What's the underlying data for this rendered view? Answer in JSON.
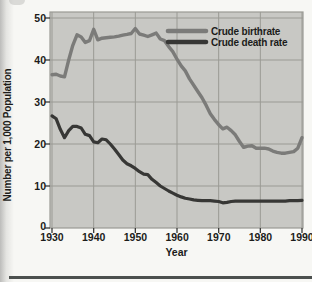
{
  "figure": {
    "bottom_rule_color": "#4c504e"
  },
  "chart_data": {
    "type": "line",
    "title": "",
    "xlabel": "Year",
    "ylabel": "Number per 1,000 Population",
    "xlim": [
      1930,
      1990
    ],
    "ylim": [
      0,
      50
    ],
    "x_ticks": [
      1930,
      1940,
      1950,
      1960,
      1970,
      1980,
      1990
    ],
    "y_ticks": [
      0,
      10,
      20,
      30,
      40,
      50
    ],
    "grid": true,
    "legend_position": "top-right-inside",
    "plot_bg": "#c8c8c4",
    "grid_color": "#9a9a94",
    "tick_color": "#3a3a38",
    "x": [
      1930,
      1931,
      1932,
      1933,
      1934,
      1935,
      1936,
      1937,
      1938,
      1939,
      1940,
      1941,
      1942,
      1943,
      1944,
      1945,
      1946,
      1947,
      1948,
      1949,
      1950,
      1951,
      1952,
      1953,
      1954,
      1955,
      1956,
      1957,
      1958,
      1959,
      1960,
      1961,
      1962,
      1963,
      1964,
      1965,
      1966,
      1967,
      1968,
      1969,
      1970,
      1971,
      1972,
      1973,
      1974,
      1975,
      1976,
      1977,
      1978,
      1979,
      1980,
      1981,
      1982,
      1983,
      1984,
      1985,
      1986,
      1987,
      1988,
      1989,
      1990
    ],
    "series": [
      {
        "name": "Crude birthrate",
        "color": "#7b7b79",
        "width": 3.4,
        "values": [
          36.5,
          36.6,
          36.2,
          36.0,
          40.0,
          43.5,
          46.0,
          45.5,
          44.2,
          44.6,
          47.3,
          44.8,
          45.2,
          45.3,
          45.4,
          45.5,
          45.7,
          45.9,
          46.1,
          46.3,
          47.5,
          46.2,
          45.9,
          45.6,
          46.0,
          46.4,
          45.0,
          44.6,
          43.2,
          42.0,
          40.2,
          38.6,
          37.4,
          35.5,
          34.0,
          32.5,
          31.0,
          29.2,
          27.2,
          25.8,
          24.6,
          23.6,
          24.0,
          23.2,
          22.2,
          20.6,
          19.2,
          19.5,
          19.6,
          19.0,
          19.0,
          19.0,
          18.8,
          18.3,
          18.0,
          17.8,
          17.8,
          18.0,
          18.2,
          19.0,
          21.5
        ]
      },
      {
        "name": "Crude death rate",
        "color": "#373735",
        "width": 3.2,
        "values": [
          26.7,
          26.0,
          23.5,
          21.5,
          23.2,
          24.2,
          24.2,
          23.8,
          22.3,
          22.0,
          20.5,
          20.3,
          21.2,
          21.0,
          20.0,
          18.8,
          17.5,
          16.2,
          15.3,
          14.8,
          14.2,
          13.4,
          12.8,
          12.7,
          11.6,
          10.8,
          10.0,
          9.4,
          8.8,
          8.3,
          7.8,
          7.4,
          7.1,
          6.9,
          6.7,
          6.6,
          6.5,
          6.5,
          6.5,
          6.4,
          6.3,
          6.0,
          6.1,
          6.3,
          6.4,
          6.4,
          6.4,
          6.4,
          6.4,
          6.4,
          6.4,
          6.4,
          6.4,
          6.4,
          6.4,
          6.4,
          6.4,
          6.5,
          6.5,
          6.5,
          6.6
        ]
      }
    ]
  }
}
